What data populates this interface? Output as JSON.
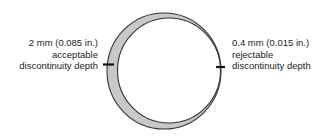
{
  "diagram": {
    "left_annotation": {
      "lines": [
        "2 mm (0.085 in.)",
        "acceptable",
        "discontinuity depth"
      ]
    },
    "right_annotation": {
      "lines": [
        "0.4 mm (0.015 in.)",
        "rejectable",
        "discontinuity depth"
      ]
    },
    "colors": {
      "wall_fill": "#c8c8c8",
      "outline": "#333333",
      "marker": "#111111",
      "text": "#222222"
    }
  }
}
